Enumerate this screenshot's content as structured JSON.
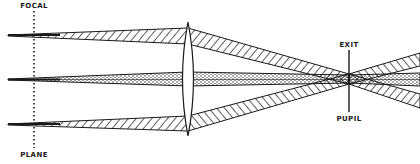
{
  "diagram": {
    "type": "optical ray diagram",
    "labels": {
      "focal_top": "FOCAL",
      "focal_bottom": "PLANE",
      "exit_top": "EXIT",
      "exit_bottom": "PUPIL"
    },
    "elements": {
      "focal_plane": {
        "x": 34,
        "style": "dotted"
      },
      "lens": {
        "x": 188,
        "type": "biconvex"
      },
      "exit_pupil": {
        "x": 349
      },
      "beams": [
        {
          "name": "upper-beam",
          "fill": "hatched",
          "y_source": 35
        },
        {
          "name": "axial-beam",
          "fill": "stippled",
          "y_source": 79
        },
        {
          "name": "lower-beam",
          "fill": "hatched",
          "y_source": 124
        }
      ]
    },
    "colors": {
      "ink": "#1a1a1a",
      "background": "#ffffff"
    }
  }
}
